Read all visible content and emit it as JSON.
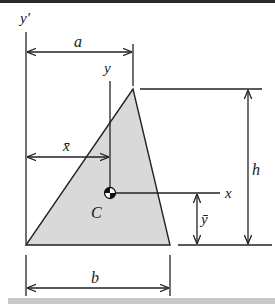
{
  "figure": {
    "colors": {
      "shape_fill": "#d9d9d9",
      "line": "#222222",
      "border_top": "#2a2a2a",
      "border_bottom": "#c8c8c8",
      "background": "#ffffff"
    },
    "labels": {
      "y_prime_axis": "y′",
      "dim_a": "a",
      "y_axis": "y",
      "x_bar": "x̄",
      "centroid": "C",
      "x_axis": "x",
      "y_bar": "ȳ",
      "dim_h": "h",
      "dim_b": "b"
    },
    "shape": {
      "type": "triangle",
      "vertices": [
        [
          26,
          245
        ],
        [
          170,
          245
        ],
        [
          133,
          89
        ]
      ]
    },
    "centroid_point": [
      110,
      193
    ]
  }
}
